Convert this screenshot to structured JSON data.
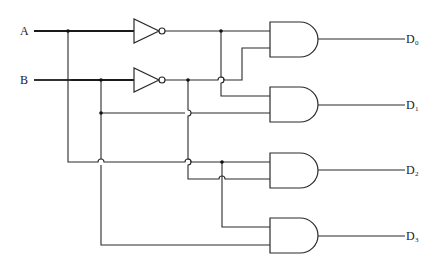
{
  "diagram": {
    "type": "2-to-4 decoder logic circuit",
    "inputs": [
      {
        "id": "A",
        "label": "A"
      },
      {
        "id": "B",
        "label": "B"
      }
    ],
    "inverters": [
      {
        "id": "not-a",
        "input": "A",
        "output": "A'"
      },
      {
        "id": "not-b",
        "input": "B",
        "output": "B'"
      }
    ],
    "and_gates": [
      {
        "id": "and-0",
        "inputs": [
          "A'",
          "B'"
        ],
        "output": "D0"
      },
      {
        "id": "and-1",
        "inputs": [
          "A'",
          "B"
        ],
        "output": "D1"
      },
      {
        "id": "and-2",
        "inputs": [
          "A",
          "B'"
        ],
        "output": "D2"
      },
      {
        "id": "and-3",
        "inputs": [
          "A",
          "B"
        ],
        "output": "D3"
      }
    ],
    "outputs": [
      {
        "id": "D0",
        "label": "D",
        "sub": "0"
      },
      {
        "id": "D1",
        "label": "D",
        "sub": "1"
      },
      {
        "id": "D2",
        "label": "D",
        "sub": "2"
      },
      {
        "id": "D3",
        "label": "D",
        "sub": "3"
      }
    ],
    "colors": {
      "line": "#2a2a2a",
      "background": "#ffffff"
    }
  }
}
